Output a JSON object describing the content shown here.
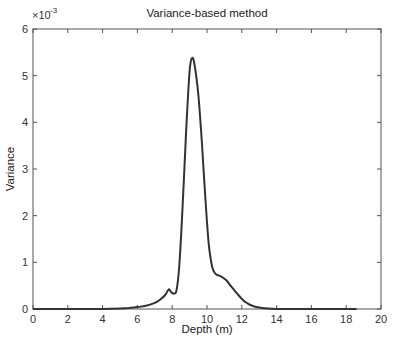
{
  "chart_data": {
    "type": "line",
    "title": "Variance-based method",
    "xlabel": "Depth (m)",
    "ylabel": "Variance",
    "y_multiplier": "×10",
    "y_multiplier_exp": "-3",
    "xlim": [
      0,
      20
    ],
    "ylim": [
      0,
      0.006
    ],
    "grid": false,
    "legend": null,
    "x_ticks": [
      "0",
      "2",
      "4",
      "6",
      "8",
      "10",
      "12",
      "14",
      "16",
      "18",
      "20"
    ],
    "y_ticks": [
      "0",
      "1",
      "2",
      "3",
      "4",
      "5",
      "6"
    ],
    "series": [
      {
        "name": "Variance",
        "color": "#333333",
        "x": [
          0,
          2,
          4,
          5,
          5.5,
          6,
          6.5,
          7,
          7.3,
          7.6,
          7.8,
          7.95,
          8.1,
          8.25,
          8.4,
          8.6,
          8.8,
          9.0,
          9.15,
          9.3,
          9.5,
          9.7,
          9.9,
          10.1,
          10.3,
          10.5,
          10.8,
          11.1,
          11.4,
          11.8,
          12.2,
          12.6,
          13.0,
          13.5,
          14,
          15,
          16,
          17,
          18,
          18.6
        ],
        "y": [
          0,
          0,
          0,
          1e-05,
          2e-05,
          4e-05,
          7e-05,
          0.00013,
          0.0002,
          0.0003,
          0.00042,
          0.00036,
          0.00033,
          0.0004,
          0.0009,
          0.0022,
          0.0038,
          0.0051,
          0.00538,
          0.0052,
          0.0046,
          0.0036,
          0.0024,
          0.0014,
          0.0009,
          0.00075,
          0.0007,
          0.00062,
          0.00048,
          0.0003,
          0.00015,
          7e-05,
          3e-05,
          1e-05,
          0,
          0,
          0,
          0,
          0,
          0
        ]
      }
    ]
  }
}
